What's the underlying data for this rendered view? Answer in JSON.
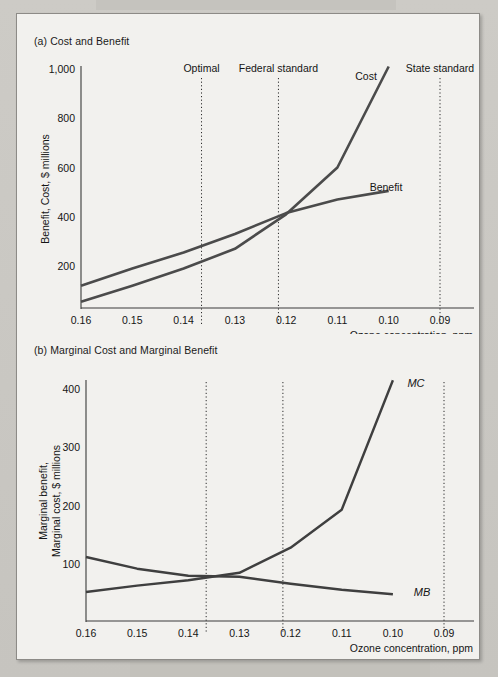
{
  "figure": {
    "panel_a": {
      "title": "(a) Cost and Benefit",
      "ylabel": "Benefit, Cost, $ millions",
      "xlabel": "Ozone concentration, ppm",
      "y_ticks": [
        "1,000",
        "800",
        "600",
        "400",
        "200"
      ],
      "x_ticks": [
        "0.16",
        "0.15",
        "0.14",
        "0.13",
        "0.12",
        "0.11",
        "0.10",
        "0.09"
      ],
      "series_labels": {
        "cost": "Cost",
        "benefit": "Benefit"
      },
      "annotations": [
        "Optimal",
        "Federal standard",
        "State standard"
      ]
    },
    "panel_b": {
      "title": "(b) Marginal Cost and Marginal Benefit",
      "ylabel_line1": "Marginal benefit,",
      "ylabel_line2": "Marginal cost, $ millions",
      "xlabel": "Ozone concentration, ppm",
      "y_ticks": [
        "400",
        "300",
        "200",
        "100"
      ],
      "x_ticks": [
        "0.16",
        "0.15",
        "0.14",
        "0.13",
        "0.12",
        "0.11",
        "0.10",
        "0.09"
      ],
      "series_labels": {
        "mc": "MC",
        "mb": "MB"
      }
    }
  },
  "chart_data": [
    {
      "type": "line",
      "panel": "a",
      "title": "(a) Cost and Benefit",
      "xlabel": "Ozone concentration, ppm",
      "ylabel": "Benefit, Cost, $ millions",
      "x_axis_reversed": true,
      "xlim": [
        0.165,
        0.085
      ],
      "ylim": [
        30,
        1050
      ],
      "xticks": [
        0.16,
        0.15,
        0.14,
        0.13,
        0.12,
        0.11,
        0.1,
        0.09
      ],
      "xticklabels": [
        "0.16",
        "0.15",
        "0.14",
        "0.13",
        "0.12",
        "0.11",
        "0.10",
        "0.09"
      ],
      "yticks": [
        200,
        400,
        600,
        800,
        1000
      ],
      "yticklabels": [
        "200",
        "400",
        "600",
        "800",
        "1,000"
      ],
      "grid": false,
      "legend": "inline-labels",
      "series": [
        {
          "name": "Cost",
          "x": [
            0.16,
            0.15,
            0.14,
            0.13,
            0.12,
            0.11,
            0.1
          ],
          "values": [
            55,
            120,
            190,
            270,
            410,
            600,
            1010
          ]
        },
        {
          "name": "Benefit",
          "x": [
            0.16,
            0.15,
            0.14,
            0.13,
            0.12,
            0.11,
            0.1
          ],
          "values": [
            120,
            190,
            255,
            330,
            415,
            470,
            505
          ]
        }
      ],
      "annotations": [
        {
          "label": "Optimal",
          "x": 0.1365,
          "type": "vertical-dotted-line"
        },
        {
          "label": "Federal standard",
          "x": 0.1215,
          "type": "vertical-dotted-line"
        },
        {
          "label": "State standard",
          "x": 0.09,
          "type": "vertical-dotted-line"
        }
      ]
    },
    {
      "type": "line",
      "panel": "b",
      "title": "(b) Marginal Cost and Marginal Benefit",
      "xlabel": "Ozone concentration, ppm",
      "ylabel": "Marginal benefit, Marginal cost, $ millions",
      "x_axis_reversed": true,
      "xlim": [
        0.165,
        0.085
      ],
      "ylim": [
        0,
        440
      ],
      "xticks": [
        0.16,
        0.15,
        0.14,
        0.13,
        0.12,
        0.11,
        0.1,
        0.09
      ],
      "xticklabels": [
        "0.16",
        "0.15",
        "0.14",
        "0.13",
        "0.12",
        "0.11",
        "0.10",
        "0.09"
      ],
      "yticks": [
        100,
        200,
        300,
        400
      ],
      "yticklabels": [
        "100",
        "200",
        "300",
        "400"
      ],
      "grid": false,
      "legend": "inline-labels",
      "series": [
        {
          "name": "MC",
          "x": [
            0.16,
            0.15,
            0.14,
            0.13,
            0.12,
            0.11,
            0.1
          ],
          "values": [
            52,
            63,
            72,
            85,
            128,
            193,
            415
          ]
        },
        {
          "name": "MB",
          "x": [
            0.16,
            0.15,
            0.14,
            0.13,
            0.12,
            0.11,
            0.1
          ],
          "values": [
            112,
            92,
            80,
            78,
            66,
            56,
            48
          ]
        }
      ],
      "annotations": [
        {
          "label": "",
          "x": 0.1365,
          "type": "vertical-dotted-line"
        },
        {
          "label": "",
          "x": 0.1215,
          "type": "vertical-dotted-line"
        },
        {
          "label": "",
          "x": 0.09,
          "type": "vertical-dotted-line"
        }
      ]
    }
  ]
}
